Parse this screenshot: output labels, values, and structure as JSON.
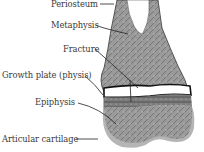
{
  "diagram": {
    "labels": [
      {
        "id": "periosteum",
        "text": "Periosteum"
      },
      {
        "id": "metaphysis",
        "text": "Metaphysis"
      },
      {
        "id": "fracture",
        "text": "Fracture"
      },
      {
        "id": "growth_plate",
        "text": "Growth plate (physis)"
      },
      {
        "id": "epiphysis",
        "text": "Epiphysis"
      },
      {
        "id": "articular_cartilage",
        "text": "Articular cartilage"
      }
    ],
    "colors": {
      "bone": "#8e8e8e",
      "bone_dark": "#5a5a5a",
      "growth_plate": "#ffffff",
      "cartilage": "#b5b5b5",
      "leader": "#222222",
      "text": "#3a3a3a"
    }
  }
}
